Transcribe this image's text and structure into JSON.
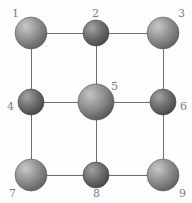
{
  "figure": {
    "type": "node-link-diagram",
    "background_color": "#fefefe",
    "edge_color": "#6e6e6e",
    "edge_width": 1,
    "label_color": "#7c7c7c",
    "label_font_size": 11,
    "canvas": {
      "width": 192,
      "height": 203
    }
  },
  "nodes": [
    {
      "id": "1",
      "label": "1",
      "cx": 31,
      "cy": 33,
      "r": 16,
      "fill": "#8f8f8f",
      "highlight": "#c9c9c9",
      "edge_shade": "#5c5c5c",
      "label_x": 12,
      "label_y": 8,
      "label_anchor": "top-left"
    },
    {
      "id": "2",
      "label": "2",
      "cx": 96,
      "cy": 33,
      "r": 13,
      "fill": "#6d6d6d",
      "highlight": "#a3a3a3",
      "edge_shade": "#444444",
      "label_x": 92,
      "label_y": 8,
      "label_anchor": "top-center"
    },
    {
      "id": "3",
      "label": "3",
      "cx": 163,
      "cy": 33,
      "r": 16,
      "fill": "#8f8f8f",
      "highlight": "#c9c9c9",
      "edge_shade": "#5c5c5c",
      "label_x": 178,
      "label_y": 8,
      "label_anchor": "top-right"
    },
    {
      "id": "4",
      "label": "4",
      "cx": 31,
      "cy": 102,
      "r": 13,
      "fill": "#6d6d6d",
      "highlight": "#a3a3a3",
      "edge_shade": "#444444",
      "label_x": 7,
      "label_y": 101,
      "label_anchor": "left"
    },
    {
      "id": "5",
      "label": "5",
      "cx": 96,
      "cy": 102,
      "r": 18,
      "fill": "#8c8c8c",
      "highlight": "#c4c4c4",
      "edge_shade": "#525252",
      "label_x": 111,
      "label_y": 81,
      "label_anchor": "upper-right"
    },
    {
      "id": "6",
      "label": "6",
      "cx": 163,
      "cy": 102,
      "r": 13,
      "fill": "#6d6d6d",
      "highlight": "#a3a3a3",
      "edge_shade": "#444444",
      "label_x": 180,
      "label_y": 101,
      "label_anchor": "right"
    },
    {
      "id": "7",
      "label": "7",
      "cx": 31,
      "cy": 175,
      "r": 16,
      "fill": "#8f8f8f",
      "highlight": "#c9c9c9",
      "edge_shade": "#5c5c5c",
      "label_x": 9,
      "label_y": 188,
      "label_anchor": "bottom-left"
    },
    {
      "id": "8",
      "label": "8",
      "cx": 96,
      "cy": 175,
      "r": 13,
      "fill": "#6d6d6d",
      "highlight": "#a3a3a3",
      "edge_shade": "#444444",
      "label_x": 93,
      "label_y": 188,
      "label_anchor": "bottom-center"
    },
    {
      "id": "9",
      "label": "9",
      "cx": 163,
      "cy": 175,
      "r": 16,
      "fill": "#8f8f8f",
      "highlight": "#c9c9c9",
      "edge_shade": "#5c5c5c",
      "label_x": 179,
      "label_y": 188,
      "label_anchor": "bottom-right"
    }
  ],
  "edges": [
    {
      "from": "1",
      "to": "2"
    },
    {
      "from": "2",
      "to": "3"
    },
    {
      "from": "4",
      "to": "5"
    },
    {
      "from": "5",
      "to": "6"
    },
    {
      "from": "7",
      "to": "8"
    },
    {
      "from": "8",
      "to": "9"
    },
    {
      "from": "1",
      "to": "4"
    },
    {
      "from": "4",
      "to": "7"
    },
    {
      "from": "2",
      "to": "5"
    },
    {
      "from": "5",
      "to": "8"
    },
    {
      "from": "3",
      "to": "6"
    },
    {
      "from": "6",
      "to": "9"
    }
  ]
}
